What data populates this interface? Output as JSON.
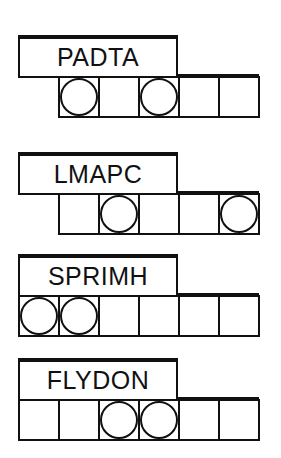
{
  "puzzles": [
    {
      "word": "PADTA",
      "top": 35,
      "cell_count": 5,
      "cell_offset": 1,
      "circles": [
        0,
        2
      ]
    },
    {
      "word": "LMAPC",
      "top": 152,
      "cell_count": 5,
      "cell_offset": 1,
      "circles": [
        1,
        4
      ]
    },
    {
      "word": "SPRIMH",
      "top": 254,
      "cell_count": 6,
      "cell_offset": 0,
      "circles": [
        0,
        1
      ]
    },
    {
      "word": "FLYDON",
      "top": 358,
      "cell_count": 6,
      "cell_offset": 0,
      "circles": [
        2,
        3
      ]
    }
  ],
  "colors": {
    "ink": "#111111",
    "background": "#ffffff"
  }
}
